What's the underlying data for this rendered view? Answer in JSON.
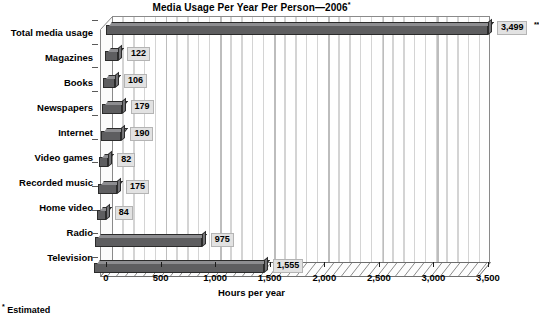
{
  "chart_data": {
    "type": "bar",
    "orientation": "horizontal",
    "title": "Media Usage Per Year Per Person—2006",
    "title_footnote_marker": "*",
    "xlabel": "Hours per year",
    "ylabel": "",
    "xlim": [
      0,
      3500
    ],
    "xticks": [
      0,
      500,
      1000,
      1500,
      2000,
      2500,
      3000,
      3500
    ],
    "xticklabels": [
      "0",
      "500",
      "1,000",
      "1,500",
      "2,000",
      "2,500",
      "3,000",
      "3,500"
    ],
    "grid": true,
    "grid_minor_step": 100,
    "legend": null,
    "categories": [
      "Total media usage",
      "Magazines",
      "Books",
      "Newspapers",
      "Internet",
      "Video games",
      "Recorded music",
      "Home video",
      "Radio",
      "Television"
    ],
    "values": [
      3499,
      122,
      106,
      179,
      190,
      82,
      175,
      84,
      975,
      1555
    ],
    "value_labels": [
      "3,499",
      "122",
      "106",
      "179",
      "190",
      "82",
      "175",
      "84",
      "975",
      "1,555"
    ],
    "value_label_markers": [
      "**",
      "",
      "",
      "",
      "",
      "",
      "",
      "",
      "",
      ""
    ],
    "bar_color": "#5e5e60",
    "bar_top_color": "#8d8d90",
    "bar_side_color": "#747477",
    "bar_edge_color": "#2b2b2b",
    "plot_background": "#ffffff",
    "gridline_color": "#d4d4d4"
  },
  "footnote": {
    "marker": "*",
    "text": "Estimated"
  }
}
